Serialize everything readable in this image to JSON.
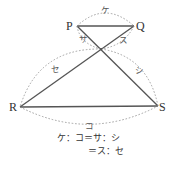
{
  "diagram": {
    "vertices": {
      "P": {
        "label": "P",
        "x": 77,
        "y": 26
      },
      "Q": {
        "label": "Q",
        "x": 134,
        "y": 26
      },
      "R": {
        "label": "R",
        "x": 20,
        "y": 107
      },
      "S": {
        "label": "S",
        "x": 158,
        "y": 106
      },
      "O": {
        "x": 101,
        "y": 49
      }
    },
    "segments": [
      "PQ",
      "PS",
      "QR",
      "RS"
    ],
    "arc_labels": {
      "PQ": "ケ",
      "RS": "コ",
      "PO": "サ",
      "OS": "シ",
      "QO": "ス",
      "OR": "セ"
    },
    "equations": {
      "line1": "ケ：コ＝サ：シ",
      "line2": "＝ス：セ"
    },
    "colors": {
      "solid_line": "#555555",
      "dashed_arc": "#999999",
      "text": "#333333"
    }
  }
}
